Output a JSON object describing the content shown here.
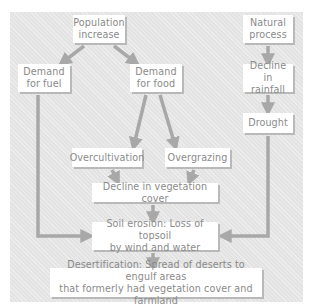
{
  "diagram": {
    "type": "flowchart",
    "colors": {
      "panel_background": "#e3e3e3",
      "box_fill": "#ffffff",
      "box_text": "#8a8a8a",
      "arrow": "#a8a8a8",
      "box_shadow": "#b9b9b9"
    },
    "nodes": {
      "population_increase": "Population\nincrease",
      "natural_process": "Natural\nprocess",
      "demand_fuel": "Demand\nfor fuel",
      "demand_food": "Demand\nfor food",
      "decline_rainfall": "Decline in\nrainfall",
      "drought": "Drought",
      "overcultivation": "Overcultivation",
      "overgrazing": "Overgrazing",
      "decline_vegetation": "Decline in vegetation cover",
      "soil_erosion": "Soil erosion: Loss of topsoil\nby wind and water",
      "desertification": "Desertification: Spread of deserts to engulf areas\nthat formerly had vegetation cover and farmland"
    },
    "edges": [
      {
        "from": "population_increase",
        "to": "demand_fuel"
      },
      {
        "from": "population_increase",
        "to": "demand_food"
      },
      {
        "from": "natural_process",
        "to": "decline_rainfall"
      },
      {
        "from": "decline_rainfall",
        "to": "drought"
      },
      {
        "from": "demand_food",
        "to": "overcultivation"
      },
      {
        "from": "demand_food",
        "to": "overgrazing"
      },
      {
        "from": "overcultivation",
        "to": "decline_vegetation"
      },
      {
        "from": "overgrazing",
        "to": "decline_vegetation"
      },
      {
        "from": "decline_vegetation",
        "to": "soil_erosion"
      },
      {
        "from": "demand_fuel",
        "to": "soil_erosion"
      },
      {
        "from": "drought",
        "to": "soil_erosion"
      },
      {
        "from": "soil_erosion",
        "to": "desertification"
      }
    ]
  }
}
